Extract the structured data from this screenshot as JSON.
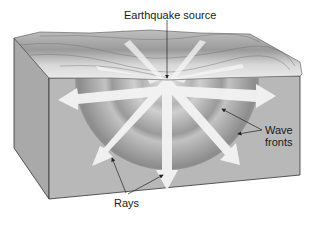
{
  "diagram": {
    "labels": {
      "source": "Earthquake source",
      "wave_fronts_line1": "Wave",
      "wave_fronts_line2": "fronts",
      "rays": "Rays"
    },
    "colors": {
      "block_front": "#b8b8b8",
      "block_side": "#a9a9a9",
      "surface": "#d6d6d6",
      "wavefront_dark": "#8f8f8f",
      "wavefront_light": "#c9c9c9",
      "ray_arrow": "#f4f4f4",
      "edge": "#333333"
    },
    "elements": {
      "wave_front_count": 3,
      "ray_count": 9
    }
  }
}
